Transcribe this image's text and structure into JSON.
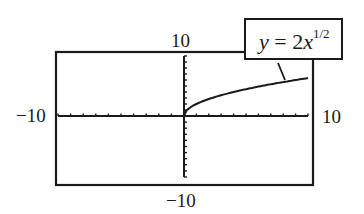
{
  "chart_data": {
    "type": "line",
    "title": "",
    "function": "y = 2x^(1/2)",
    "annotation": {
      "prefix": "y",
      "eq": " = 2",
      "var": "x",
      "exp": "1/2"
    },
    "xlim": [
      -10,
      10
    ],
    "ylim": [
      -10,
      10
    ],
    "x_tick_step": 1,
    "y_tick_step": 1,
    "axis_labels": {
      "xmin": "−10",
      "xmax": "10",
      "ymin": "−10",
      "ymax": "10"
    },
    "grid": false,
    "series": [
      {
        "name": "y = 2x^(1/2)",
        "x": [
          0,
          1,
          2,
          3,
          4,
          5,
          6,
          7,
          8,
          9,
          10
        ],
        "y": [
          0,
          2,
          2.83,
          3.46,
          4,
          4.47,
          4.9,
          5.29,
          5.66,
          6,
          6.32
        ]
      }
    ],
    "colors": {
      "line": "#1a1a1a",
      "frame": "#1a1a1a",
      "background": "#ffffff"
    }
  }
}
